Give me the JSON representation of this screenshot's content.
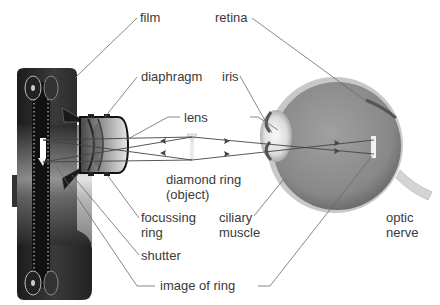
{
  "diagram": {
    "labels": {
      "film": "film",
      "diaphragm": "diaphragm",
      "lens": "lens",
      "diamond_ring_line1": "diamond ring",
      "diamond_ring_line2": "(object)",
      "focussing_ring_line1": "focussing",
      "focussing_ring_line2": "ring",
      "shutter": "shutter",
      "image_of_ring": "image of ring",
      "retina": "retina",
      "iris": "iris",
      "ciliary_muscle_line1": "ciliary",
      "ciliary_muscle_line2": "muscle",
      "optic_nerve_line1": "optic",
      "optic_nerve_line2": "nerve"
    },
    "colors": {
      "label_text": "#3a3a3a",
      "leader_line": "#6a6a6a",
      "camera_body": "#2a2a2a",
      "eyeball": "#8c8c8c"
    }
  }
}
